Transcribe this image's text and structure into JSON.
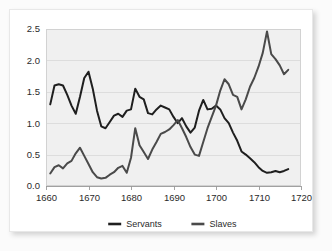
{
  "chart_data": {
    "type": "line",
    "title": "",
    "subtitle": "",
    "xlabel": "",
    "ylabel": "",
    "xlim": [
      1660,
      1720
    ],
    "ylim": [
      0.0,
      2.5
    ],
    "grid": true,
    "legend_position": "bottom-center",
    "xticks": [
      "1660",
      "1670",
      "1680",
      "1690",
      "1700",
      "1710",
      "1720"
    ],
    "xtick_values": [
      1660,
      1670,
      1680,
      1690,
      1700,
      1710,
      1720
    ],
    "yticks": [
      "0.0",
      "0.5",
      "1.0",
      "1.5",
      "2.0",
      "2.5"
    ],
    "ytick_values": [
      0.0,
      0.5,
      1.0,
      1.5,
      2.0,
      2.5
    ],
    "series": [
      {
        "name": "Servants",
        "color": "#1f1f1f",
        "x": [
          1661,
          1662,
          1663,
          1664,
          1665,
          1666,
          1667,
          1668,
          1669,
          1670,
          1671,
          1672,
          1673,
          1674,
          1675,
          1676,
          1677,
          1678,
          1679,
          1680,
          1681,
          1682,
          1683,
          1684,
          1685,
          1686,
          1687,
          1688,
          1689,
          1690,
          1691,
          1692,
          1693,
          1694,
          1695,
          1696,
          1697,
          1698,
          1699,
          1700,
          1701,
          1702,
          1703,
          1704,
          1705,
          1706,
          1707,
          1708,
          1709,
          1710,
          1711,
          1712,
          1713,
          1714,
          1715,
          1716,
          1717
        ],
        "values": [
          1.3,
          1.6,
          1.62,
          1.6,
          1.45,
          1.28,
          1.15,
          1.42,
          1.72,
          1.82,
          1.55,
          1.2,
          0.95,
          0.92,
          1.02,
          1.12,
          1.15,
          1.1,
          1.2,
          1.22,
          1.55,
          1.42,
          1.38,
          1.16,
          1.14,
          1.22,
          1.28,
          1.25,
          1.22,
          1.1,
          1.0,
          1.08,
          0.95,
          0.85,
          0.93,
          1.2,
          1.37,
          1.22,
          1.23,
          1.28,
          1.22,
          1.08,
          1.0,
          0.85,
          0.72,
          0.55,
          0.5,
          0.44,
          0.38,
          0.3,
          0.24,
          0.21,
          0.22,
          0.24,
          0.22,
          0.24,
          0.27
        ]
      },
      {
        "name": "Slaves",
        "color": "#4a4a4a",
        "x": [
          1661,
          1662,
          1663,
          1664,
          1665,
          1666,
          1667,
          1668,
          1669,
          1670,
          1671,
          1672,
          1673,
          1674,
          1675,
          1676,
          1677,
          1678,
          1679,
          1680,
          1681,
          1682,
          1683,
          1684,
          1685,
          1686,
          1687,
          1688,
          1689,
          1690,
          1691,
          1692,
          1693,
          1694,
          1695,
          1696,
          1697,
          1698,
          1699,
          1700,
          1701,
          1702,
          1703,
          1704,
          1705,
          1706,
          1707,
          1708,
          1709,
          1710,
          1711,
          1712,
          1713,
          1714,
          1715,
          1716,
          1717
        ],
        "values": [
          0.2,
          0.3,
          0.33,
          0.28,
          0.36,
          0.4,
          0.52,
          0.61,
          0.48,
          0.35,
          0.22,
          0.14,
          0.12,
          0.13,
          0.18,
          0.22,
          0.29,
          0.32,
          0.21,
          0.45,
          0.92,
          0.65,
          0.54,
          0.43,
          0.58,
          0.7,
          0.83,
          0.86,
          0.9,
          0.97,
          1.05,
          0.92,
          0.78,
          0.62,
          0.5,
          0.48,
          0.7,
          0.92,
          1.1,
          1.28,
          1.52,
          1.7,
          1.62,
          1.45,
          1.42,
          1.22,
          1.38,
          1.58,
          1.72,
          1.9,
          2.12,
          2.46,
          2.1,
          2.02,
          1.92,
          1.78,
          1.85
        ]
      }
    ],
    "legend": [
      {
        "label": "Servants",
        "color": "#1f1f1f"
      },
      {
        "label": "Slaves",
        "color": "#4a4a4a"
      }
    ]
  },
  "axes": {
    "x_axis_name": "year-axis",
    "y_axis_name": "value-axis"
  }
}
